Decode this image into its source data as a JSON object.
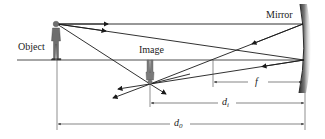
{
  "diagram": {
    "type": "concave-mirror-ray-diagram",
    "labels": {
      "object": "Object",
      "image": "Image",
      "mirror": "Mirror",
      "focal_length": "f",
      "image_distance_main": "d",
      "image_distance_sub": "i",
      "object_distance_main": "d",
      "object_distance_sub": "0"
    },
    "colors": {
      "ray": "#1a1a1a",
      "axis": "#222222",
      "dimension": "#333333",
      "mirror_dark": "#3a3a3a",
      "mirror_light": "#c8c8c8",
      "figure": "#6e6e6e"
    }
  }
}
